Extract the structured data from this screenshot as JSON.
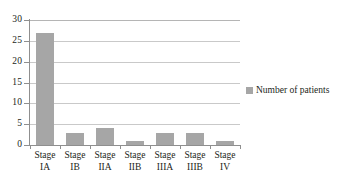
{
  "chart_data": {
    "type": "bar",
    "title": "",
    "subtitle": "",
    "xlabel": "",
    "ylabel": "",
    "categories": [
      "Stage IA",
      "Stage IB",
      "Stage IIA",
      "Stage IIB",
      "Stage IIIA",
      "Stage IIIB",
      "Stage IV"
    ],
    "category_lines": [
      {
        "line1": "Stage",
        "line2": "IA"
      },
      {
        "line1": "Stage",
        "line2": "IB"
      },
      {
        "line1": "Stage",
        "line2": "IIA"
      },
      {
        "line1": "Stage",
        "line2": "IIB"
      },
      {
        "line1": "Stage",
        "line2": "IIIA"
      },
      {
        "line1": "Stage",
        "line2": "IIIB"
      },
      {
        "line1": "Stage",
        "line2": "IV"
      }
    ],
    "series": [
      {
        "name": "Number of patients",
        "values": [
          27,
          3,
          4,
          1,
          3,
          3,
          1
        ],
        "color": "#a6a6a6"
      }
    ],
    "values": [
      27,
      3,
      4,
      1,
      3,
      3,
      1
    ],
    "ylim": [
      0,
      30
    ],
    "ytick_values": [
      0,
      5,
      10,
      15,
      20,
      25,
      30
    ],
    "ytick_labels": [
      "0",
      "5",
      "10",
      "15",
      "20",
      "25",
      "30"
    ],
    "grid": true,
    "grid_axis": "y",
    "legend_position": "right",
    "legend_entries": [
      {
        "label": "Number of patients",
        "color": "#a6a6a6"
      }
    ],
    "colors": {
      "bar": "#a6a6a6",
      "gridline": "#c9c9c9",
      "axis": "#8f8f8f",
      "text": "#231f20",
      "background": "#ffffff"
    }
  }
}
